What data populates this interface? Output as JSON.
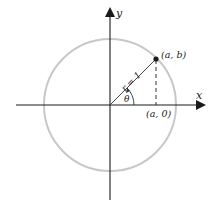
{
  "diagram": {
    "axes": {
      "x_label": "x",
      "y_label": "y"
    },
    "circle": {
      "radius_label": "r = 1",
      "color": "#c8c8c8"
    },
    "point": {
      "label": "(a, b)"
    },
    "foot": {
      "label": "(a, 0)"
    },
    "angle": {
      "label": "θ"
    },
    "colors": {
      "axis": "#1a1a1a",
      "circle": "#c8c8c8",
      "radius": "#333333",
      "dashed": "#333333"
    }
  }
}
